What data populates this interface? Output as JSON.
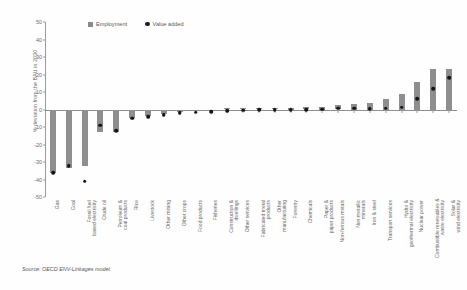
{
  "figure": {
    "source_note": "Source: OECD ENV-Linkages model."
  },
  "legend": {
    "items": [
      {
        "label": "Employment",
        "marker": "square-swatch-icon",
        "color": "#8e8e90"
      },
      {
        "label": "Value added",
        "marker": "circle-dot-icon",
        "color": "#151517"
      }
    ]
  },
  "chart_data": {
    "type": "bar",
    "title": "",
    "subtitle": "",
    "xlabel": "",
    "ylabel": "% deviation from the BAU in 2030",
    "ylim": [
      -50,
      50
    ],
    "yticks": [
      50,
      40,
      30,
      20,
      10,
      0,
      -10,
      -20,
      -30,
      -40,
      -50
    ],
    "ytick_labels": [
      "50",
      "40",
      "30",
      "20",
      "10",
      "0",
      "-10",
      "-20",
      "-30",
      "-40",
      "-50"
    ],
    "grid": false,
    "legend_position": "top-center",
    "categories": [
      "Gas",
      "Coal",
      "Fossil fuel based electricity",
      "Crude oil",
      "Petroleum & coal products",
      "Rice",
      "Livestock",
      "Other mining",
      "Other crops",
      "Food products",
      "Fisheries",
      "Construction & dwellings",
      "Other services",
      "Fabricated metal products",
      "Other manufacturing",
      "Forestry",
      "Chemicals",
      "Paper & paper products",
      "Non-ferrous metals",
      "Non-metallic minerals",
      "Iron & steel",
      "Transport services",
      "Hydro & geothermal electricity",
      "Nuclear power",
      "Combustible renewables & waste electricity",
      "Solar & wind electricity"
    ],
    "series": [
      {
        "name": "Employment",
        "type": "bar",
        "color": "#8e8e90",
        "values": [
          -36,
          -33.5,
          -32,
          -13,
          -13,
          -5,
          -3.5,
          -2.5,
          -1.5,
          -1,
          -0.8,
          0.6,
          0.8,
          0.8,
          0.9,
          1,
          1.2,
          1.5,
          2.4,
          3,
          4,
          6,
          9,
          16,
          23,
          23
        ]
      },
      {
        "name": "Value added",
        "type": "scatter",
        "color": "#151517",
        "values": [
          -35,
          -31,
          -40,
          -8,
          -11,
          -4,
          -3,
          -2,
          -1,
          -0.6,
          -0.4,
          0.4,
          0.6,
          0.7,
          0.8,
          0.9,
          1,
          1.2,
          1.6,
          1.8,
          1.5,
          1.8,
          2.4,
          7,
          13,
          19
        ]
      }
    ],
    "extra_right_bars": {
      "note": "two right-most categories",
      "employment": [
        38,
        44
      ],
      "value_added": [
        32,
        34
      ]
    }
  }
}
